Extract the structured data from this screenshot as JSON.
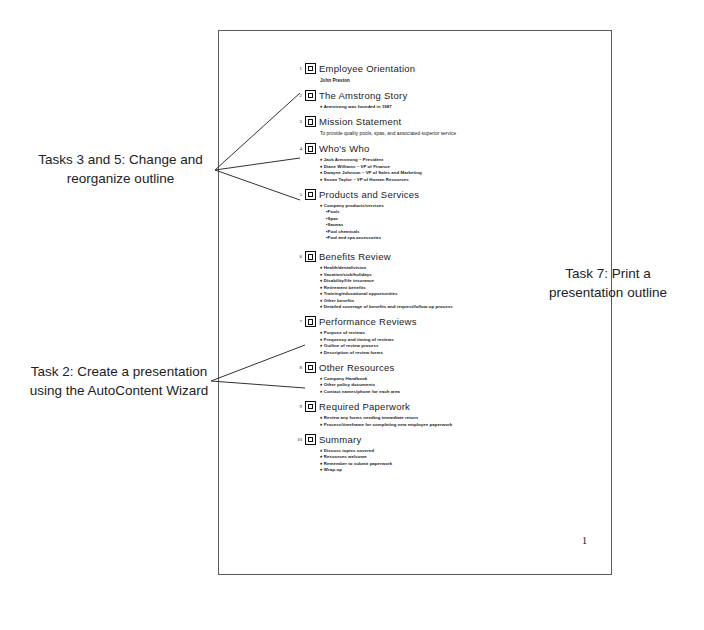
{
  "page": {
    "page_number": "1"
  },
  "annotations": [
    {
      "id": "tasks-3-5",
      "line1": "Tasks 3 and 5: Change and",
      "line2": "reorganize outline"
    },
    {
      "id": "task-2",
      "line1": "Task 2: Create a presentation",
      "line2": "using the AutoContent Wizard"
    },
    {
      "id": "task-7",
      "line1": "Task 7: Print a",
      "line2": "presentation outline"
    }
  ],
  "outline": {
    "slides": [
      {
        "number": "1",
        "title": "Employee Orientation",
        "subtitle": "John Preston",
        "items": []
      },
      {
        "number": "2",
        "title": "The Amstrong Story",
        "items": [
          {
            "level": 1,
            "text": "Armstrong was founded in 1987"
          }
        ]
      },
      {
        "number": "3",
        "title": "Mission Statement",
        "subtitle": "To provide quality pools, spas, and associated superior service",
        "items": []
      },
      {
        "number": "4",
        "title": "Who's Who",
        "items": [
          {
            "level": 1,
            "text": "Jack Armstrong – President"
          },
          {
            "level": 1,
            "text": "Diane Williams – VP of Finance"
          },
          {
            "level": 1,
            "text": "Dwayne Johnson – VP of Sales and Marketing"
          },
          {
            "level": 1,
            "text": "Susan Taylor – VP of Human Resources"
          }
        ]
      },
      {
        "number": "5",
        "title": "Products and Services",
        "items": [
          {
            "level": 1,
            "text": "Company products/services"
          },
          {
            "level": 2,
            "text": "Pools"
          },
          {
            "level": 2,
            "text": "Spas"
          },
          {
            "level": 2,
            "text": "Saunas"
          },
          {
            "level": 2,
            "text": "Pool chemicals"
          },
          {
            "level": 2,
            "text": "Pool and spa accessories"
          }
        ]
      },
      {
        "number": "6",
        "title": "Benefits Review",
        "items": [
          {
            "level": 1,
            "text": "Health/dental/vision"
          },
          {
            "level": 1,
            "text": "Vacation/sick/holidays"
          },
          {
            "level": 1,
            "text": "Disability/life insurance"
          },
          {
            "level": 1,
            "text": "Retirement benefits"
          },
          {
            "level": 1,
            "text": "Training/educational opportunities"
          },
          {
            "level": 1,
            "text": "Other benefits"
          },
          {
            "level": 1,
            "text": "Detailed coverage of benefits and request/follow-up process"
          }
        ]
      },
      {
        "number": "7",
        "title": "Performance Reviews",
        "items": [
          {
            "level": 1,
            "text": "Purpose of reviews"
          },
          {
            "level": 1,
            "text": "Frequency and timing of reviews"
          },
          {
            "level": 1,
            "text": "Outline of review process"
          },
          {
            "level": 1,
            "text": "Description of review forms"
          }
        ]
      },
      {
        "number": "8",
        "title": "Other Resources",
        "items": [
          {
            "level": 1,
            "text": "Company Handbook"
          },
          {
            "level": 1,
            "text": "Other policy documents"
          },
          {
            "level": 1,
            "text": "Contact names/phone for each area"
          }
        ]
      },
      {
        "number": "9",
        "title": "Required Paperwork",
        "items": [
          {
            "level": 1,
            "text": "Review any forms needing immediate return"
          },
          {
            "level": 1,
            "text": "Process/timeframe for completing new employee paperwork"
          }
        ]
      },
      {
        "number": "10",
        "title": "Summary",
        "items": [
          {
            "level": 1,
            "text": "Discuss topics covered"
          },
          {
            "level": 1,
            "text": "Resources welcome"
          },
          {
            "level": 1,
            "text": "Remember to submit paperwork"
          },
          {
            "level": 1,
            "text": "Wrap-up"
          }
        ]
      }
    ]
  }
}
